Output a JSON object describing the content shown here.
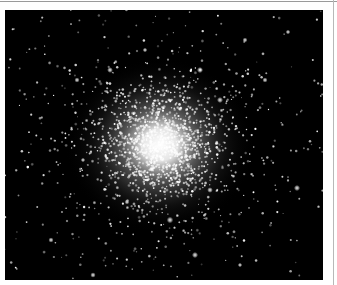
{
  "image": {
    "subject": "globular star cluster",
    "alt": "Dense globular star cluster on black sky background",
    "colors": {
      "sky": "#000000",
      "frame": "#ffffff",
      "star": "#ffffff"
    }
  }
}
